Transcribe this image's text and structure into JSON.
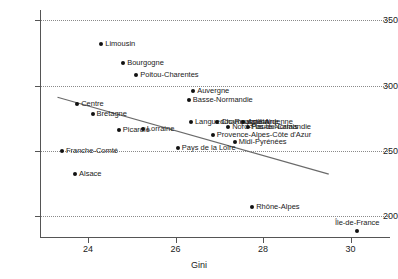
{
  "chart_data": {
    "type": "scatter",
    "title": "",
    "xlabel": "Gini",
    "ylabel": "",
    "xlim": [
      22.9,
      30.9
    ],
    "ylim": [
      183,
      358
    ],
    "grid": true,
    "legend": "none",
    "xticks": [
      24,
      26,
      28,
      30
    ],
    "yticks": [
      200,
      250,
      300,
      350
    ],
    "xtick_labels": [
      "24",
      "26",
      "28",
      "30"
    ],
    "ytick_labels": [
      "200",
      "250",
      "300",
      "350"
    ],
    "points": [
      {
        "label": "Limousin",
        "x": 24.3,
        "y": 332,
        "label_pos": "right"
      },
      {
        "label": "Bourgogne",
        "x": 24.8,
        "y": 317,
        "label_pos": "right"
      },
      {
        "label": "Poitou-Charentes",
        "x": 25.1,
        "y": 308,
        "label_pos": "right"
      },
      {
        "label": "Auvergne",
        "x": 26.4,
        "y": 296,
        "label_pos": "right"
      },
      {
        "label": "Basse-Normandie",
        "x": 26.3,
        "y": 289,
        "label_pos": "right"
      },
      {
        "label": "Centre",
        "x": 23.75,
        "y": 286,
        "label_pos": "right"
      },
      {
        "label": "Bretagne",
        "x": 24.1,
        "y": 278,
        "label_pos": "right"
      },
      {
        "label": "Languedoc-Roussillon",
        "x": 26.35,
        "y": 272,
        "label_pos": "right"
      },
      {
        "label": "Champagne-Ardenne",
        "x": 26.95,
        "y": 272,
        "label_pos": "right"
      },
      {
        "label": "Aquitaine",
        "x": 27.55,
        "y": 272,
        "label_pos": "right"
      },
      {
        "label": "Nord-Pas-de-Calais",
        "x": 27.2,
        "y": 268,
        "label_pos": "right"
      },
      {
        "label": "Haute-Normandie",
        "x": 27.65,
        "y": 268,
        "label_pos": "right"
      },
      {
        "label": "Picardie",
        "x": 24.7,
        "y": 266,
        "label_pos": "right"
      },
      {
        "label": "Lorraine",
        "x": 25.25,
        "y": 267,
        "label_pos": "right"
      },
      {
        "label": "Provence-Alpes-Côte d'Azur",
        "x": 26.85,
        "y": 262,
        "label_pos": "right"
      },
      {
        "label": "Midi-Pyrénées",
        "x": 27.35,
        "y": 257,
        "label_pos": "right"
      },
      {
        "label": "Pays de la Loire",
        "x": 26.05,
        "y": 252,
        "label_pos": "right"
      },
      {
        "label": "Franche-Comté",
        "x": 23.4,
        "y": 250,
        "label_pos": "right"
      },
      {
        "label": "Alsace",
        "x": 23.7,
        "y": 232,
        "label_pos": "right"
      },
      {
        "label": "Rhône-Alpes",
        "x": 27.75,
        "y": 207,
        "label_pos": "right"
      },
      {
        "label": "Île-de-France",
        "x": 30.15,
        "y": 188,
        "label_pos": "above"
      }
    ],
    "trend_line": {
      "x0": 23.3,
      "y0": 291,
      "x1": 29.5,
      "y1": 232
    },
    "colors": {
      "marker": "#111111",
      "trend": "#6a6a6a",
      "grid": "#8a8a8a",
      "axis": "#555555",
      "text": "#1a1a1a",
      "background": "#ffffff"
    }
  }
}
